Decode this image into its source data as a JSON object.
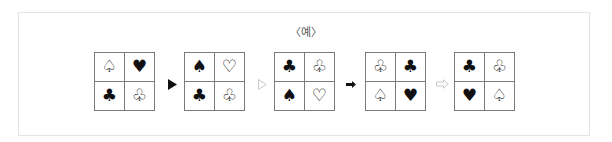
{
  "caption": "〈예〉",
  "colors": {
    "frame_border": "#e4e4e4",
    "grid_border": "#7a7a7a",
    "symbol": "#111111",
    "arrow_dark": "#111111",
    "arrow_light": "#c8c8c8"
  },
  "sequence": [
    {
      "type": "grid",
      "cells": [
        {
          "symbol": "♤",
          "icon": "spade-outline-icon"
        },
        {
          "symbol": "♥",
          "icon": "heart-filled-icon"
        },
        {
          "symbol": "♣",
          "icon": "club-filled-icon"
        },
        {
          "symbol": "♧",
          "icon": "club-outline-icon"
        }
      ]
    },
    {
      "type": "arrow",
      "icon": "filled-triangle-arrow-icon",
      "glyph": "▶"
    },
    {
      "type": "grid",
      "cells": [
        {
          "symbol": "♠",
          "icon": "spade-filled-icon"
        },
        {
          "symbol": "♡",
          "icon": "heart-outline-icon"
        },
        {
          "symbol": "♣",
          "icon": "club-filled-icon"
        },
        {
          "symbol": "♧",
          "icon": "club-outline-icon"
        }
      ]
    },
    {
      "type": "arrow",
      "icon": "outline-triangle-arrow-icon",
      "glyph": "▷"
    },
    {
      "type": "grid",
      "cells": [
        {
          "symbol": "♣",
          "icon": "club-filled-icon"
        },
        {
          "symbol": "♧",
          "icon": "club-outline-icon"
        },
        {
          "symbol": "♠",
          "icon": "spade-filled-icon"
        },
        {
          "symbol": "♡",
          "icon": "heart-outline-icon"
        }
      ]
    },
    {
      "type": "arrow",
      "icon": "filled-block-arrow-icon",
      "glyph": "➡"
    },
    {
      "type": "grid",
      "cells": [
        {
          "symbol": "♧",
          "icon": "club-outline-icon"
        },
        {
          "symbol": "♣",
          "icon": "club-filled-icon"
        },
        {
          "symbol": "♤",
          "icon": "spade-outline-icon"
        },
        {
          "symbol": "♥",
          "icon": "heart-filled-icon"
        }
      ]
    },
    {
      "type": "arrow",
      "icon": "outline-block-arrow-icon",
      "glyph": "⇨"
    },
    {
      "type": "grid",
      "cells": [
        {
          "symbol": "♣",
          "icon": "club-filled-icon"
        },
        {
          "symbol": "♧",
          "icon": "club-outline-icon"
        },
        {
          "symbol": "♥",
          "icon": "heart-filled-icon"
        },
        {
          "symbol": "♤",
          "icon": "spade-outline-icon"
        }
      ]
    }
  ],
  "grids": {
    "g1": [
      "♤",
      "♥",
      "♣",
      "♧"
    ],
    "g2": [
      "♠",
      "♡",
      "♣",
      "♧"
    ],
    "g3": [
      "♣",
      "♧",
      "♠",
      "♡"
    ],
    "g4": [
      "♧",
      "♣",
      "♤",
      "♥"
    ],
    "g5": [
      "♣",
      "♧",
      "♥",
      "♤"
    ]
  }
}
